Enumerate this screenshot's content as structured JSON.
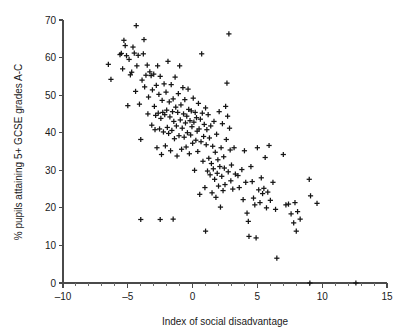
{
  "chart_data": {
    "type": "scatter",
    "title": "",
    "subtitle": "",
    "xlabel": "Index of social disadvantage",
    "ylabel": "% pupils attaining 5+ GCSE grades A-C",
    "xlim": [
      -10,
      15
    ],
    "ylim": [
      0,
      70
    ],
    "xticks": [
      -10,
      -5,
      0,
      5,
      10,
      15
    ],
    "xticklabels": [
      "–10",
      "–5",
      "0",
      "5",
      "10",
      "15"
    ],
    "yticks": [
      0,
      10,
      20,
      30,
      40,
      50,
      60,
      70
    ],
    "yticklabels": [
      "0",
      "10",
      "20",
      "30",
      "40",
      "50",
      "60",
      "70"
    ],
    "x_minor_tick_step": 1,
    "grid": false,
    "legend": null,
    "marker": "plus",
    "marker_color": "#151515",
    "series": [
      {
        "name": "Schools",
        "points": [
          [
            -6.5,
            58.2
          ],
          [
            -6.3,
            54.2
          ],
          [
            -5.6,
            60.8
          ],
          [
            -5.5,
            61.1
          ],
          [
            -5.4,
            57.0
          ],
          [
            -5.3,
            64.6
          ],
          [
            -5.2,
            63.2
          ],
          [
            -5.1,
            60.5
          ],
          [
            -5.0,
            47.2
          ],
          [
            -4.9,
            59.5
          ],
          [
            -4.8,
            55.4
          ],
          [
            -4.7,
            56.1
          ],
          [
            -4.6,
            62.8
          ],
          [
            -4.5,
            61.2
          ],
          [
            -4.4,
            51.0
          ],
          [
            -4.35,
            68.5
          ],
          [
            -4.3,
            57.8
          ],
          [
            -4.2,
            60.6
          ],
          [
            -4.1,
            47.6
          ],
          [
            -4.0,
            38.2
          ],
          [
            -4.0,
            16.9
          ],
          [
            -3.9,
            54.0
          ],
          [
            -3.8,
            61.0
          ],
          [
            -3.75,
            64.8
          ],
          [
            -3.7,
            52.2
          ],
          [
            -3.6,
            55.3
          ],
          [
            -3.5,
            58.0
          ],
          [
            -3.45,
            45.0
          ],
          [
            -3.4,
            49.5
          ],
          [
            -3.3,
            56.2
          ],
          [
            -3.2,
            55.2
          ],
          [
            -3.15,
            42.0
          ],
          [
            -3.1,
            51.4
          ],
          [
            -3.0,
            55.6
          ],
          [
            -2.95,
            47.0
          ],
          [
            -2.9,
            40.8
          ],
          [
            -2.85,
            44.6
          ],
          [
            -2.8,
            52.6
          ],
          [
            -2.75,
            36.0
          ],
          [
            -2.7,
            57.8
          ],
          [
            -2.65,
            45.2
          ],
          [
            -2.6,
            50.2
          ],
          [
            -2.55,
            41.0
          ],
          [
            -2.5,
            55.0
          ],
          [
            -2.5,
            16.9
          ],
          [
            -2.45,
            43.8
          ],
          [
            -2.4,
            34.2
          ],
          [
            -2.35,
            48.6
          ],
          [
            -2.3,
            45.4
          ],
          [
            -2.25,
            40.2
          ],
          [
            -2.2,
            53.0
          ],
          [
            -2.15,
            44.8
          ],
          [
            -2.1,
            36.5
          ],
          [
            -2.05,
            50.8
          ],
          [
            -2.0,
            46.0
          ],
          [
            -1.95,
            41.4
          ],
          [
            -1.9,
            59.0
          ],
          [
            -1.85,
            39.8
          ],
          [
            -1.8,
            48.2
          ],
          [
            -1.75,
            44.2
          ],
          [
            -1.7,
            35.2
          ],
          [
            -1.65,
            52.8
          ],
          [
            -1.6,
            40.6
          ],
          [
            -1.55,
            45.6
          ],
          [
            -1.5,
            49.0
          ],
          [
            -1.5,
            17.0
          ],
          [
            -1.45,
            43.0
          ],
          [
            -1.4,
            38.4
          ],
          [
            -1.35,
            54.8
          ],
          [
            -1.3,
            46.8
          ],
          [
            -1.25,
            41.8
          ],
          [
            -1.2,
            33.8
          ],
          [
            -1.15,
            45.4
          ],
          [
            -1.1,
            50.4
          ],
          [
            -1.05,
            39.2
          ],
          [
            -1.0,
            57.8
          ],
          [
            -0.95,
            43.4
          ],
          [
            -0.9,
            47.4
          ],
          [
            -0.85,
            35.6
          ],
          [
            -0.8,
            41.2
          ],
          [
            -0.75,
            52.0
          ],
          [
            -0.7,
            45.0
          ],
          [
            -0.65,
            38.8
          ],
          [
            -0.6,
            48.8
          ],
          [
            -0.55,
            42.6
          ],
          [
            -0.5,
            36.2
          ],
          [
            -0.45,
            44.4
          ],
          [
            -0.4,
            40.0
          ],
          [
            -0.35,
            51.6
          ],
          [
            -0.3,
            46.2
          ],
          [
            -0.25,
            34.4
          ],
          [
            -0.2,
            43.2
          ],
          [
            -0.15,
            39.4
          ],
          [
            -0.1,
            45.8
          ],
          [
            -0.05,
            41.6
          ],
          [
            0.0,
            37.2
          ],
          [
            0.05,
            49.2
          ],
          [
            0.1,
            42.8
          ],
          [
            0.15,
            30.0
          ],
          [
            0.2,
            45.4
          ],
          [
            0.25,
            38.0
          ],
          [
            0.3,
            44.0
          ],
          [
            0.35,
            40.4
          ],
          [
            0.4,
            35.0
          ],
          [
            0.45,
            47.8
          ],
          [
            0.5,
            41.0
          ],
          [
            0.55,
            23.6
          ],
          [
            0.6,
            43.6
          ],
          [
            0.65,
            37.6
          ],
          [
            0.7,
            61.0
          ],
          [
            0.75,
            45.2
          ],
          [
            0.8,
            32.4
          ],
          [
            0.85,
            39.0
          ],
          [
            0.9,
            42.2
          ],
          [
            0.95,
            25.4
          ],
          [
            1.0,
            46.6
          ],
          [
            1.0,
            13.8
          ],
          [
            1.05,
            36.8
          ],
          [
            1.1,
            40.8
          ],
          [
            1.15,
            29.8
          ],
          [
            1.2,
            44.8
          ],
          [
            1.25,
            33.2
          ],
          [
            1.3,
            38.6
          ],
          [
            1.35,
            28.8
          ],
          [
            1.4,
            41.8
          ],
          [
            1.45,
            31.8
          ],
          [
            1.5,
            24.0
          ],
          [
            1.55,
            36.4
          ],
          [
            1.6,
            30.4
          ],
          [
            1.65,
            43.0
          ],
          [
            1.7,
            27.6
          ],
          [
            1.75,
            34.8
          ],
          [
            1.8,
            22.8
          ],
          [
            1.85,
            39.6
          ],
          [
            1.9,
            29.2
          ],
          [
            1.95,
            32.8
          ],
          [
            2.0,
            25.8
          ],
          [
            2.05,
            45.6
          ],
          [
            2.1,
            31.0
          ],
          [
            2.15,
            20.2
          ],
          [
            2.2,
            36.0
          ],
          [
            2.25,
            28.4
          ],
          [
            2.3,
            42.4
          ],
          [
            2.35,
            24.6
          ],
          [
            2.4,
            33.6
          ],
          [
            2.45,
            30.6
          ],
          [
            2.5,
            26.2
          ],
          [
            2.55,
            47.0
          ],
          [
            2.6,
            38.2
          ],
          [
            2.65,
            53.2
          ],
          [
            2.7,
            44.4
          ],
          [
            2.75,
            29.6
          ],
          [
            2.8,
            66.3
          ],
          [
            2.85,
            41.2
          ],
          [
            2.9,
            35.4
          ],
          [
            2.95,
            27.2
          ],
          [
            3.0,
            31.4
          ],
          [
            3.1,
            25.0
          ],
          [
            3.2,
            36.0
          ],
          [
            3.3,
            29.0
          ],
          [
            3.5,
            28.6
          ],
          [
            3.6,
            25.4
          ],
          [
            3.8,
            30.2
          ],
          [
            3.9,
            22.2
          ],
          [
            4.0,
            35.2
          ],
          [
            4.1,
            26.8
          ],
          [
            4.2,
            18.6
          ],
          [
            4.3,
            16.4
          ],
          [
            4.35,
            12.4
          ],
          [
            4.5,
            31.0
          ],
          [
            4.6,
            27.0
          ],
          [
            4.7,
            22.6
          ],
          [
            4.8,
            20.8
          ],
          [
            4.9,
            12.0
          ],
          [
            5.0,
            36.0
          ],
          [
            5.1,
            24.8
          ],
          [
            5.2,
            21.4
          ],
          [
            5.3,
            28.0
          ],
          [
            5.4,
            23.8
          ],
          [
            5.5,
            25.2
          ],
          [
            5.6,
            33.4
          ],
          [
            5.7,
            20.0
          ],
          [
            5.8,
            24.2
          ],
          [
            5.9,
            36.6
          ],
          [
            6.0,
            22.0
          ],
          [
            6.2,
            26.8
          ],
          [
            6.4,
            19.6
          ],
          [
            6.5,
            6.6
          ],
          [
            7.0,
            34.2
          ],
          [
            7.2,
            20.8
          ],
          [
            7.4,
            21.0
          ],
          [
            7.6,
            18.4
          ],
          [
            7.8,
            16.0
          ],
          [
            7.9,
            21.4
          ],
          [
            8.0,
            13.8
          ],
          [
            8.1,
            19.0
          ],
          [
            8.3,
            17.0
          ],
          [
            9.0,
            27.6
          ],
          [
            9.1,
            23.2
          ],
          [
            9.05,
            0.0
          ],
          [
            9.6,
            21.2
          ],
          [
            12.6,
            0.0
          ]
        ]
      }
    ]
  },
  "axis": {
    "y_tick_labels": [
      "70",
      "60",
      "50",
      "40",
      "30",
      "20",
      "10",
      "0"
    ],
    "x_tick_labels": [
      "–10",
      "–5",
      "0",
      "5",
      "10",
      "15"
    ],
    "x_title": "Index of social disadvantage",
    "y_title": "% pupils attaining 5+ GCSE grades A-C"
  }
}
